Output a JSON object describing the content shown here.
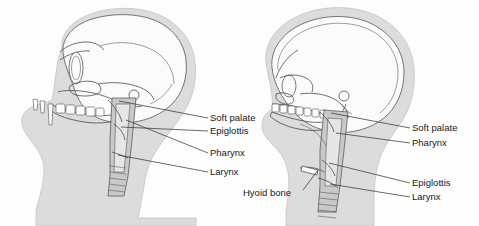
{
  "figure": {
    "background_color": "#fdfdfd",
    "soft_tissue_color": "#dcdcdc",
    "bone_color": "#fbfbfb",
    "line_color": "#2b2b2b",
    "text_color": "#1a1a1a"
  },
  "left_figure": {
    "name": "ape-skull-sagittal-section",
    "labels": [
      {
        "id": "soft-palate",
        "text": "Soft palate",
        "x": 210,
        "y": 121
      },
      {
        "id": "epiglottis",
        "text": "Epiglottis",
        "x": 210,
        "y": 134
      },
      {
        "id": "pharynx",
        "text": "Pharynx",
        "x": 210,
        "y": 156
      },
      {
        "id": "larynx",
        "text": "Larynx",
        "x": 210,
        "y": 175
      }
    ]
  },
  "right_figure": {
    "name": "human-skull-sagittal-section",
    "labels": [
      {
        "id": "soft-palate",
        "text": "Soft palate",
        "x": 412,
        "y": 131
      },
      {
        "id": "pharynx",
        "text": "Pharynx",
        "x": 412,
        "y": 146
      },
      {
        "id": "epiglottis",
        "text": "Epiglottis",
        "x": 412,
        "y": 186
      },
      {
        "id": "larynx",
        "text": "Larynx",
        "x": 412,
        "y": 200
      },
      {
        "id": "hyoid-bone",
        "text": "Hyoid bone",
        "x": 243,
        "y": 196
      }
    ]
  }
}
